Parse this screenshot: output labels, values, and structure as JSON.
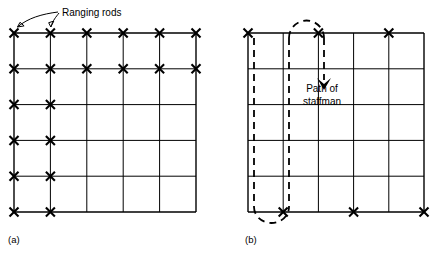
{
  "figure": {
    "background_color": "#ffffff",
    "ink_color": "#000000",
    "panels": [
      {
        "id": "a",
        "label": "(a)",
        "label_pos": {
          "x": 8,
          "y": 243
        },
        "grid": {
          "x0": 14,
          "y0": 33,
          "x1": 196,
          "y1": 212,
          "cols": 6,
          "rows": 6,
          "col_x": [
            14,
            50.4,
            86.8,
            123.2,
            159.6,
            196
          ],
          "row_y": [
            33,
            68.8,
            104.6,
            140.4,
            176.2,
            212
          ]
        },
        "rod_marks": [
          {
            "col": 0,
            "row": 0
          },
          {
            "col": 1,
            "row": 0
          },
          {
            "col": 2,
            "row": 0
          },
          {
            "col": 3,
            "row": 0
          },
          {
            "col": 4,
            "row": 0
          },
          {
            "col": 5,
            "row": 0
          },
          {
            "col": 0,
            "row": 1
          },
          {
            "col": 1,
            "row": 1
          },
          {
            "col": 2,
            "row": 1
          },
          {
            "col": 3,
            "row": 1
          },
          {
            "col": 4,
            "row": 1
          },
          {
            "col": 5,
            "row": 1
          },
          {
            "col": 0,
            "row": 2
          },
          {
            "col": 1,
            "row": 2
          },
          {
            "col": 0,
            "row": 3
          },
          {
            "col": 1,
            "row": 3
          },
          {
            "col": 0,
            "row": 4
          },
          {
            "col": 1,
            "row": 4
          },
          {
            "col": 0,
            "row": 5
          },
          {
            "col": 1,
            "row": 5
          }
        ],
        "annotation": {
          "text": "Ranging rods",
          "text_pos": {
            "x": 62,
            "y": 13
          },
          "arrow_targets": [
            {
              "col": 0,
              "row": 0
            },
            {
              "col": 1,
              "row": 0
            }
          ]
        }
      },
      {
        "id": "b",
        "label": "(b)",
        "label_pos": {
          "x": 245,
          "y": 243
        },
        "grid": {
          "x0": 248,
          "y0": 33,
          "x1": 424,
          "y1": 212,
          "cols": 6,
          "rows": 6,
          "col_x": [
            248,
            283.2,
            318.4,
            353.6,
            388.8,
            424
          ],
          "row_y": [
            33,
            68.8,
            104.6,
            140.4,
            176.2,
            212
          ]
        },
        "rod_marks": [
          {
            "col": 0,
            "row": 0
          },
          {
            "col": 2,
            "row": 0
          },
          {
            "col": 4,
            "row": 0
          },
          {
            "col": 1,
            "row": 5
          },
          {
            "col": 3,
            "row": 5
          },
          {
            "col": 5,
            "row": 5
          }
        ],
        "path": {
          "label_line1": "Path of",
          "label_line2": "staffman",
          "label_pos": {
            "x": 322,
            "y": 92
          },
          "dashed_verticals": [
            {
              "x": 254,
              "y_top": 38,
              "y_bottom": 207
            },
            {
              "x": 289,
              "y_top": 38,
              "y_bottom": 207
            },
            {
              "x": 324,
              "y_top": 38,
              "y_bottom": 80
            }
          ],
          "arcs": [
            {
              "type": "top-arc",
              "x_left": 289,
              "x_right": 324,
              "y": 33,
              "rise": 26
            },
            {
              "type": "bottom-arc",
              "x_left": 254,
              "x_right": 289,
              "y": 212,
              "drop": 22
            }
          ],
          "arrow_head": {
            "x": 324,
            "y": 84,
            "direction": "down"
          }
        }
      }
    ]
  }
}
